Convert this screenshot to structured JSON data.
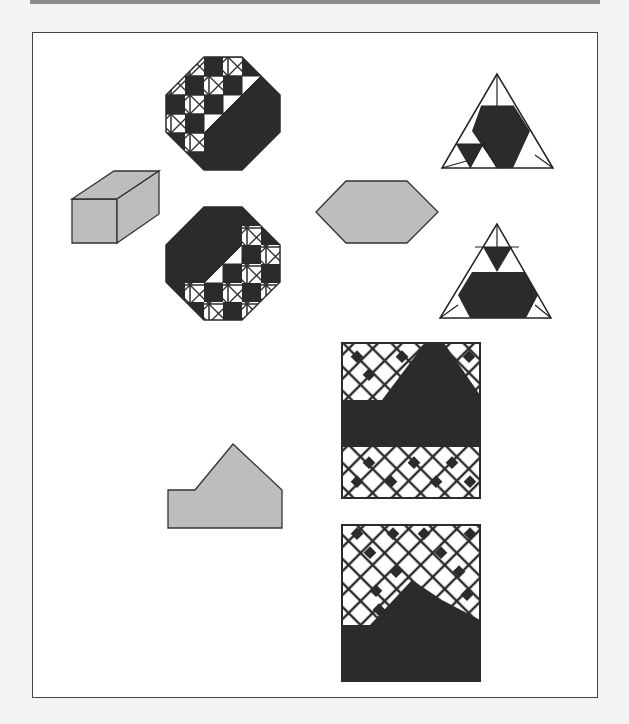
{
  "colors": {
    "dark": "#2b2b2b",
    "gray_fill": "#bdbdbd",
    "stroke": "#333333",
    "frame_bg": "#ffffff",
    "page_bg": "#f3f3f3"
  },
  "figures": [
    {
      "id": "octagon-top",
      "type": "octagon-grid",
      "description": "Dark octagon with white X-boxes checker pattern on upper-left diagonal half"
    },
    {
      "id": "octagon-bottom",
      "type": "octagon-grid",
      "description": "Dark octagon with white X-boxes checker pattern on lower-right diagonal half"
    },
    {
      "id": "prism",
      "type": "rectangular-prism",
      "description": "Gray 3D rectangular box"
    },
    {
      "id": "hexagon",
      "type": "hexagon",
      "description": "Gray elongated hexagon"
    },
    {
      "id": "triangle-top",
      "type": "triangle-pattern",
      "description": "Triangle with dark inner hexagon region and small dark triangle bottom-left"
    },
    {
      "id": "triangle-bottom",
      "type": "triangle-pattern",
      "description": "Triangle with dark lower hexagon and small dark inverted triangle top"
    },
    {
      "id": "pentagon",
      "type": "house-pentagon",
      "description": "Gray irregular house-shaped pentagon"
    },
    {
      "id": "rect-pattern-top",
      "type": "diamond-lattice",
      "description": "Rectangle with diamond lattice top and bottom, dark middle band"
    },
    {
      "id": "rect-pattern-bottom",
      "type": "diamond-lattice",
      "description": "Rectangle with diamond lattice top, dark bottom"
    }
  ]
}
